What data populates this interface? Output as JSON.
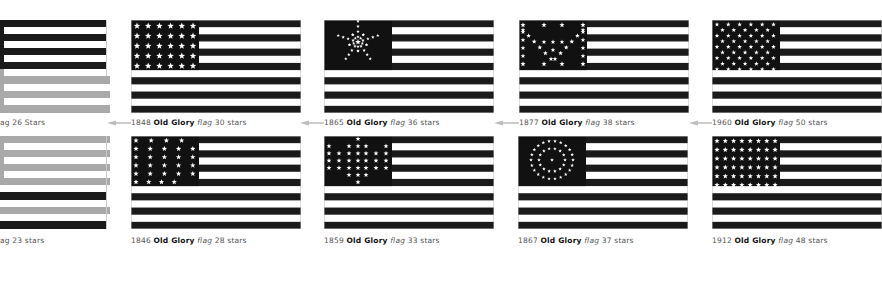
{
  "colors": {
    "dark": "#1a1a1a",
    "light": "#ffffff",
    "faded": "#a9a9a9",
    "caption": "#555555",
    "arrow": "#bdbdbd"
  },
  "row1": [
    {
      "id": "partial-26",
      "year": "",
      "name": "",
      "word": "ag",
      "stars": "26 Stars",
      "caption_prefix": "ag 26 Stars",
      "star_count": 26
    },
    {
      "id": "flag-1848",
      "year": "1848",
      "name": "Old Glory",
      "word": "flag",
      "stars": "30 stars",
      "star_count": 30,
      "pattern": "grid-6x5"
    },
    {
      "id": "flag-1865",
      "year": "1865",
      "name": "Old Glory",
      "word": "flag",
      "stars": "36 stars",
      "star_count": 36,
      "pattern": "great-star"
    },
    {
      "id": "flag-1877",
      "year": "1877",
      "name": "Old Glory",
      "word": "flag",
      "stars": "38 stars",
      "star_count": 38,
      "pattern": "x-pattern"
    },
    {
      "id": "flag-1960",
      "year": "1960",
      "name": "Old Glory",
      "word": "flag",
      "stars": "50 stars",
      "star_count": 50,
      "pattern": "staggered-50"
    }
  ],
  "row2": [
    {
      "id": "partial-23",
      "year": "",
      "name": "",
      "word": "ag",
      "stars": "23 stars",
      "caption_prefix": "ag 23 stars",
      "star_count": 23
    },
    {
      "id": "flag-1846",
      "year": "1846",
      "name": "Old Glory",
      "word": "flag",
      "stars": "28 stars",
      "star_count": 28,
      "pattern": "grid-28"
    },
    {
      "id": "flag-1859",
      "year": "1859",
      "name": "Old Glory",
      "word": "flag",
      "stars": "33 stars",
      "star_count": 33,
      "pattern": "diamond-33"
    },
    {
      "id": "flag-1867",
      "year": "1867",
      "name": "Old Glory",
      "word": "flag",
      "stars": "37 stars",
      "star_count": 37,
      "pattern": "rings-37"
    },
    {
      "id": "flag-1912",
      "year": "1912",
      "name": "Old Glory",
      "word": "flag",
      "stars": "48 stars",
      "star_count": 48,
      "pattern": "grid-8x6"
    }
  ],
  "arrows": [
    {
      "label": "arrow-to-1848",
      "direction": "left"
    },
    {
      "label": "arrow-to-1865",
      "direction": "left"
    },
    {
      "label": "arrow-to-1877",
      "direction": "left"
    },
    {
      "label": "arrow-to-1960",
      "direction": "left"
    }
  ]
}
